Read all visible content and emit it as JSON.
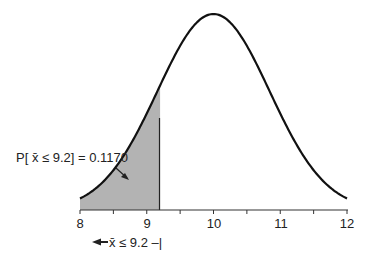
{
  "chart_data": {
    "type": "area",
    "title": "",
    "xlabel": "",
    "ylabel": "",
    "distribution": "normal",
    "mean": 10,
    "std_dev": 0.84,
    "xlim": [
      8,
      12
    ],
    "grid": false,
    "x_ticks": [
      "8",
      "9",
      "10",
      "11",
      "12"
    ],
    "shaded_region": {
      "from": 8,
      "to": 9.2,
      "color": "#b3b3b3"
    },
    "annotations": [
      {
        "text": "P[ x̄ ≤ 9.2] = 0.1170",
        "type": "probability-label"
      },
      {
        "text": "←x̄ ≤ 9.2 –|",
        "type": "range-label"
      }
    ],
    "probability": 0.117,
    "threshold": 9.2
  },
  "colors": {
    "curve": "#111111",
    "shade": "#b3b3b3",
    "axis": "#333333"
  },
  "labels": {
    "prob_label": "P[ x̄ ≤ 9.2] = 0.1170",
    "range_label": "x̄ ≤ 9.2 –|",
    "ticks": [
      "8",
      "9",
      "10",
      "11",
      "12"
    ]
  }
}
